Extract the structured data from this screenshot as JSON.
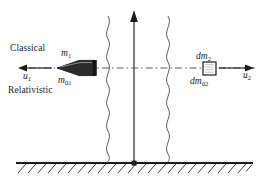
{
  "figure": {
    "background_color": "#ffffff",
    "ink_color": "#1a1a1a"
  },
  "labels": {
    "classical": "Classical",
    "relativistic": "Relativistic",
    "u1_var": "u",
    "u1_sub": "1",
    "m1_var": "m",
    "m1_sub": "1",
    "m01_var": "m",
    "m01_sub": "01",
    "dm2_var": "dm",
    "dm2_sub": "2",
    "dm02_var": "dm",
    "dm02_sub": "02",
    "u2_var": "u",
    "u2_sub": "2"
  },
  "elements": {
    "left_arrow_name": "velocity-arrow-left",
    "right_arrow_name": "velocity-arrow-right",
    "vertical_arrow_name": "vertical-axis-arrow",
    "bullet_name": "projectile-bullet",
    "mass_box_name": "mass-element-box",
    "wavy_left_name": "wavy-line-left",
    "wavy_right_name": "wavy-line-right",
    "ground_name": "hatched-ground",
    "axis_name": "horizontal-dash-dot-axis"
  },
  "geometry": {
    "axis_y": 68,
    "ground_y": 163,
    "vertical_axis_x": 134,
    "wavy_left_x": 108,
    "wavy_right_x": 168,
    "box_x": 203,
    "box_y": 62
  }
}
